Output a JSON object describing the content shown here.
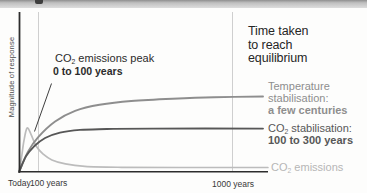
{
  "palette": {
    "background": "#fdfdfc",
    "top_bar_gradient_top": "#8f8f8f",
    "top_bar_gradient_bottom": "#dddddd",
    "heading_text": "#262626",
    "annotation_text": "#2b2b2b",
    "axis_color": "#2d2d2d",
    "gridline_color": "#cfcfcf",
    "temperature_gray": "#8e8e8e",
    "co2_stab_gray": "#575757",
    "co2_emissions_gray": "#b6b6b6"
  },
  "heading": {
    "line1": "Time taken",
    "line2": "to reach",
    "line3": "equilibrium"
  },
  "annotation": {
    "prefix": "CO",
    "sub": "2",
    "rest": " emissions peak",
    "line2": "0 to 100 years"
  },
  "axis": {
    "y_label": "Magnitude of response",
    "x_ticks": [
      "Today",
      "100 years",
      "1000 years"
    ]
  },
  "labels": {
    "temperature": {
      "line1": "Temperature",
      "line2": "stabilisation:",
      "bold": "a few centuries"
    },
    "co2_stab": {
      "prefix": "CO",
      "sub": "2",
      "rest": " stabilisation:",
      "bold": "100 to 300 years"
    },
    "co2_emissions": {
      "prefix": "CO",
      "sub": "2",
      "rest": " emissions"
    }
  },
  "chart_data": {
    "type": "line",
    "title": "Time taken to reach equilibrium",
    "xlabel": "",
    "ylabel": "Magnitude of response",
    "x_ticks": [
      "Today",
      "100 years",
      "1000 years"
    ],
    "x_units": "fraction of plot width (0 = Today, ~0.08 = 100 years, ~0.87 = 1000 years; schematic time axis)",
    "y_units": "relative magnitude of response (temperature equilibrium level = 1.0)",
    "ylim": [
      0,
      1.05
    ],
    "grid": "vertical gridlines at 100 years and 1000 years only",
    "legend_position": "right margin, each label aligned to its curve end",
    "annotation": {
      "text_line1": "CO2 emissions peak",
      "text_line2": "0 to 100 years",
      "target": "peak of CO2 emissions curve before the 100-years gridline"
    },
    "series": [
      {
        "name": "Temperature stabilisation",
        "equilibrium_time": "a few centuries",
        "color": "#8e8e8e",
        "points": [
          [
            0,
            0
          ],
          [
            0.037,
            0.27
          ],
          [
            0.078,
            0.46
          ],
          [
            0.148,
            0.67
          ],
          [
            0.23,
            0.81
          ],
          [
            0.33,
            0.89
          ],
          [
            0.46,
            0.94
          ],
          [
            0.63,
            0.971
          ],
          [
            0.8,
            0.99
          ],
          [
            1.0,
            1.0
          ]
        ]
      },
      {
        "name": "CO2 stabilisation",
        "equilibrium_time": "100 to 300 years",
        "color": "#575757",
        "points": [
          [
            0,
            0
          ],
          [
            0.029,
            0.21
          ],
          [
            0.062,
            0.34
          ],
          [
            0.107,
            0.45
          ],
          [
            0.168,
            0.52
          ],
          [
            0.25,
            0.557
          ],
          [
            0.36,
            0.569
          ],
          [
            0.55,
            0.575
          ],
          [
            1.0,
            0.575
          ]
        ]
      },
      {
        "name": "CO2 emissions",
        "equilibrium_time": "peak 0 to 100 years",
        "color": "#bcbcbc",
        "points": [
          [
            0,
            0
          ],
          [
            0.01,
            0.185
          ],
          [
            0.02,
            0.41
          ],
          [
            0.033,
            0.583
          ],
          [
            0.049,
            0.5
          ],
          [
            0.07,
            0.345
          ],
          [
            0.098,
            0.24
          ],
          [
            0.135,
            0.16
          ],
          [
            0.19,
            0.107
          ],
          [
            0.27,
            0.074
          ],
          [
            0.42,
            0.062
          ],
          [
            0.66,
            0.06
          ],
          [
            1.02,
            0.06
          ]
        ]
      }
    ]
  }
}
